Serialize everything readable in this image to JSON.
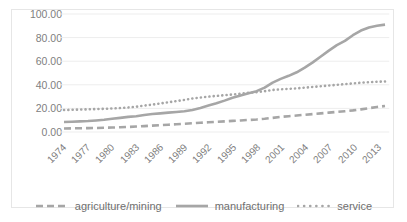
{
  "caption_cut": "",
  "chart_data": {
    "type": "line",
    "title": "",
    "xlabel": "",
    "ylabel": "",
    "ylim": [
      0,
      100
    ],
    "ytick_labels": [
      "100.00",
      "80.00",
      "60.00",
      "40.00",
      "20.00",
      "0.00"
    ],
    "ytick_values": [
      100,
      80,
      60,
      40,
      20,
      0
    ],
    "grid": true,
    "legend_position": "bottom",
    "x": [
      1974,
      1975,
      1976,
      1977,
      1978,
      1979,
      1980,
      1981,
      1982,
      1983,
      1984,
      1985,
      1986,
      1987,
      1988,
      1989,
      1990,
      1991,
      1992,
      1993,
      1994,
      1995,
      1996,
      1997,
      1998,
      1999,
      2000,
      2001,
      2002,
      2003,
      2004,
      2005,
      2006,
      2007,
      2008,
      2009,
      2010,
      2011,
      2012,
      2013,
      2014
    ],
    "xtick_labels": [
      "1974",
      "1977",
      "1980",
      "1983",
      "1986",
      "1989",
      "1992",
      "1995",
      "1998",
      "2001",
      "2004",
      "2007",
      "2010",
      "2013"
    ],
    "series": [
      {
        "name": "agriculture/mining",
        "style": "dashed",
        "color": "#a6a6a6",
        "values": [
          3.0,
          3.1,
          3.2,
          3.3,
          3.4,
          3.6,
          3.8,
          4.0,
          4.3,
          4.6,
          5.0,
          5.4,
          5.8,
          6.2,
          6.6,
          7.0,
          7.4,
          7.8,
          8.2,
          8.6,
          9.0,
          9.4,
          9.8,
          10.2,
          10.6,
          11.2,
          12.0,
          12.8,
          13.4,
          14.0,
          14.6,
          15.2,
          15.8,
          16.4,
          17.0,
          17.6,
          18.3,
          19.2,
          20.2,
          21.2,
          22.0
        ]
      },
      {
        "name": "manufacturing",
        "style": "solid",
        "color": "#a6a6a6",
        "values": [
          8.5,
          8.7,
          9.0,
          9.3,
          9.8,
          10.4,
          11.2,
          12.0,
          12.8,
          13.4,
          14.4,
          15.2,
          15.8,
          16.4,
          17.0,
          17.6,
          18.6,
          20.4,
          22.4,
          24.4,
          26.6,
          29.0,
          31.0,
          32.8,
          34.6,
          37.6,
          41.8,
          45.0,
          47.6,
          50.6,
          54.6,
          59.0,
          64.0,
          69.0,
          73.6,
          77.2,
          82.0,
          86.0,
          88.6,
          90.0,
          91.0
        ]
      },
      {
        "name": "service",
        "style": "dotted",
        "color": "#a6a6a6",
        "values": [
          18.6,
          18.8,
          19.0,
          19.2,
          19.4,
          19.6,
          19.9,
          20.3,
          20.8,
          21.4,
          22.4,
          23.2,
          24.2,
          25.2,
          26.2,
          27.2,
          28.4,
          29.2,
          30.0,
          30.6,
          31.2,
          31.8,
          32.4,
          33.2,
          33.8,
          34.6,
          35.6,
          36.2,
          36.6,
          37.0,
          37.6,
          38.2,
          38.8,
          39.4,
          40.0,
          40.6,
          41.2,
          41.8,
          42.2,
          42.6,
          42.8
        ]
      }
    ]
  },
  "legend": {
    "items": [
      {
        "label": "agriculture/mining",
        "icon": "dashed-line-swatch"
      },
      {
        "label": "manufacturing",
        "icon": "solid-line-swatch"
      },
      {
        "label": "service",
        "icon": "dotted-line-swatch"
      }
    ]
  }
}
